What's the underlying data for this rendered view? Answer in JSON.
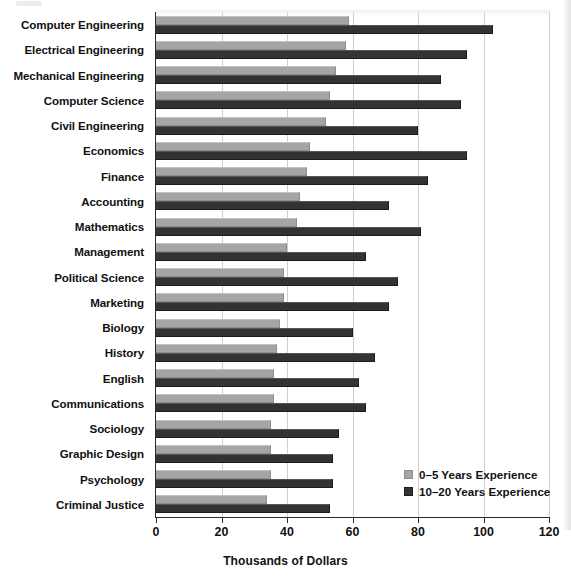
{
  "chart_data": {
    "type": "bar",
    "orientation": "horizontal",
    "title": "",
    "xlabel": "Thousands of Dollars",
    "ylabel": "",
    "xlim": [
      0,
      120
    ],
    "xticks": [
      0,
      20,
      40,
      60,
      80,
      100,
      120
    ],
    "grid": "vertical",
    "legend_position": "bottom-right",
    "categories": [
      "Computer Engineering",
      "Electrical Engineering",
      "Mechanical Engineering",
      "Computer Science",
      "Civil Engineering",
      "Economics",
      "Finance",
      "Accounting",
      "Mathematics",
      "Management",
      "Political Science",
      "Marketing",
      "Biology",
      "History",
      "English",
      "Communications",
      "Sociology",
      "Graphic Design",
      "Psychology",
      "Criminal Justice"
    ],
    "series": [
      {
        "name": "0–5 Years Experience",
        "color": "#a5a5a5",
        "values": [
          59,
          58,
          55,
          53,
          52,
          47,
          46,
          44,
          43,
          40,
          39,
          39,
          38,
          37,
          36,
          36,
          35,
          35,
          35,
          34
        ]
      },
      {
        "name": "10–20 Years Experience",
        "color": "#333333",
        "values": [
          103,
          95,
          87,
          93,
          80,
          95,
          83,
          71,
          81,
          64,
          74,
          71,
          60,
          67,
          62,
          64,
          56,
          54,
          54,
          53
        ]
      }
    ]
  },
  "legend": {
    "items": [
      {
        "label": "0–5 Years Experience",
        "swatch": "light"
      },
      {
        "label": "10–20 Years Experience",
        "swatch": "dark"
      }
    ]
  },
  "axis": {
    "x_title": "Thousands of Dollars"
  }
}
